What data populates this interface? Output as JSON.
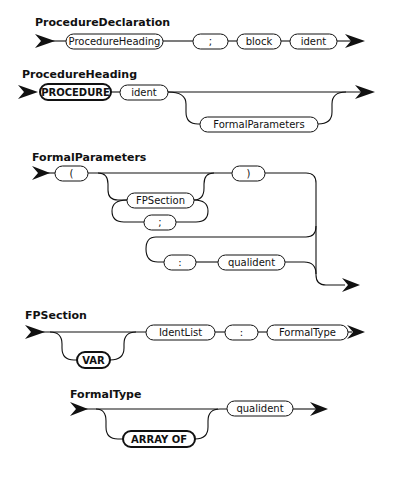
{
  "diagrams": {
    "procedure_declaration": {
      "title": "ProcedureDeclaration",
      "elements": [
        "ProcedureHeading",
        ";",
        "block",
        "ident"
      ]
    },
    "procedure_heading": {
      "title": "ProcedureHeading",
      "keyword": "PROCEDURE",
      "ident": "ident",
      "optional": "FormalParameters"
    },
    "formal_parameters": {
      "title": "FormalParameters",
      "open_paren": "(",
      "section": "FPSection",
      "separator": ";",
      "close_paren": ")",
      "colon": ":",
      "result_type": "qualident"
    },
    "fp_section": {
      "title": "FPSection",
      "optional_keyword": "VAR",
      "ident_list": "IdentList",
      "colon": ":",
      "formal_type": "FormalType"
    },
    "formal_type": {
      "title": "FormalType",
      "optional_keyword": "ARRAY OF",
      "qualident": "qualident"
    }
  }
}
